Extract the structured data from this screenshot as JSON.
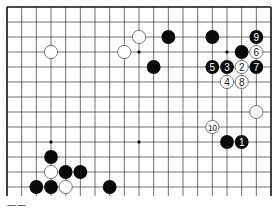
{
  "diagram": {
    "type": "go-board-partial",
    "board_size": 19,
    "visible_rows": 13,
    "origin": {
      "x": 7,
      "y": 7
    },
    "spacing": {
      "x": 14.667,
      "y": 15
    },
    "colors": {
      "line": "#333333",
      "border": "#111111",
      "black": "#0a0a0a",
      "white": "#ffffff",
      "white_stroke": "#555555"
    },
    "hoshi": [
      {
        "col": 3,
        "row": 3
      },
      {
        "col": 9,
        "row": 3
      },
      {
        "col": 15,
        "row": 3
      },
      {
        "col": 3,
        "row": 9
      },
      {
        "col": 9,
        "row": 9
      },
      {
        "col": 15,
        "row": 9
      }
    ],
    "stones": [
      {
        "color": "white",
        "col": 3,
        "row": 3,
        "label": ""
      },
      {
        "color": "white",
        "col": 8,
        "row": 3,
        "label": ""
      },
      {
        "color": "white",
        "col": 9,
        "row": 2,
        "label": ""
      },
      {
        "color": "black",
        "col": 11,
        "row": 2,
        "label": ""
      },
      {
        "color": "black",
        "col": 14,
        "row": 2,
        "label": ""
      },
      {
        "color": "black",
        "col": 17,
        "row": 2,
        "label": "9"
      },
      {
        "color": "black",
        "col": 16,
        "row": 3,
        "label": ""
      },
      {
        "color": "white",
        "col": 17,
        "row": 3,
        "label": "6"
      },
      {
        "color": "black",
        "col": 10,
        "row": 4,
        "label": ""
      },
      {
        "color": "black",
        "col": 14,
        "row": 4,
        "label": "5"
      },
      {
        "color": "black",
        "col": 15,
        "row": 4,
        "label": "3"
      },
      {
        "color": "white",
        "col": 16,
        "row": 4,
        "label": "2"
      },
      {
        "color": "black",
        "col": 17,
        "row": 4,
        "label": "7"
      },
      {
        "color": "white",
        "col": 15,
        "row": 5,
        "label": "4"
      },
      {
        "color": "white",
        "col": 16,
        "row": 5,
        "label": "8"
      },
      {
        "color": "white",
        "col": 17,
        "row": 7,
        "label": ""
      },
      {
        "color": "white",
        "col": 14,
        "row": 8,
        "label": "10"
      },
      {
        "color": "black",
        "col": 15,
        "row": 9,
        "label": ""
      },
      {
        "color": "black",
        "col": 16,
        "row": 9,
        "label": "1"
      },
      {
        "color": "black",
        "col": 3,
        "row": 10,
        "label": ""
      },
      {
        "color": "white",
        "col": 3,
        "row": 11,
        "label": ""
      },
      {
        "color": "black",
        "col": 4,
        "row": 11,
        "label": ""
      },
      {
        "color": "black",
        "col": 5,
        "row": 11,
        "label": ""
      },
      {
        "color": "black",
        "col": 2,
        "row": 12,
        "label": ""
      },
      {
        "color": "black",
        "col": 3,
        "row": 12,
        "label": ""
      },
      {
        "color": "white",
        "col": 4,
        "row": 12,
        "label": ""
      },
      {
        "color": "black",
        "col": 7,
        "row": 12,
        "label": ""
      }
    ],
    "caption": "一一"
  }
}
